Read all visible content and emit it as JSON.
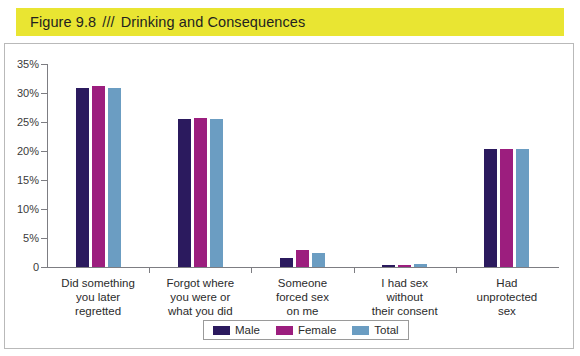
{
  "figure": {
    "label": "Figure 9.8",
    "separator": "///",
    "title": "Drinking and Consequences",
    "band_color": "#e9e532"
  },
  "chart_data": {
    "type": "bar",
    "title": "Drinking and Consequences",
    "xlabel": "",
    "ylabel": "",
    "ylim": [
      0,
      35
    ],
    "ytick_labels": [
      "0",
      "5%",
      "10%",
      "15%",
      "20%",
      "25%",
      "30%",
      "35%"
    ],
    "ytick_values": [
      0,
      5,
      10,
      15,
      20,
      25,
      30,
      35
    ],
    "grid": false,
    "legend_position": "bottom-center",
    "categories": [
      "Did something\nyou later\nregretted",
      "Forgot where\nyou were or\nwhat you did",
      "Someone\nforced sex\non me",
      "I had sex\nwithout\ntheir consent",
      "Had\nunprotected\nsex"
    ],
    "series": [
      {
        "name": "Male",
        "color": "#2b1a5e",
        "values": [
          30.8,
          25.6,
          1.5,
          0.4,
          20.3
        ]
      },
      {
        "name": "Female",
        "color": "#9c1e7e",
        "values": [
          31.2,
          25.7,
          3.0,
          0.3,
          20.4
        ]
      },
      {
        "name": "Total",
        "color": "#6b9dc2",
        "values": [
          30.9,
          25.6,
          2.4,
          0.5,
          20.3
        ]
      }
    ]
  },
  "legend": {
    "entries": [
      {
        "label": "Male",
        "color": "#2b1a5e"
      },
      {
        "label": "Female",
        "color": "#9c1e7e"
      },
      {
        "label": "Total",
        "color": "#6b9dc2"
      }
    ]
  }
}
